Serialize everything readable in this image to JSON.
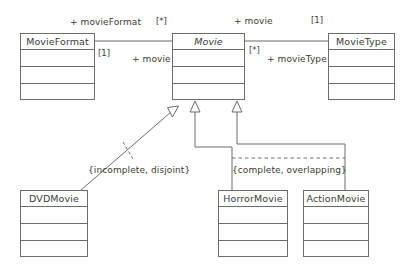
{
  "diagram": {
    "type": "uml-class-diagram",
    "classes": [
      {
        "id": "movieformat",
        "name": "MovieFormat",
        "abstract": false,
        "compartments": 3
      },
      {
        "id": "movie",
        "name": "Movie",
        "abstract": true,
        "compartments": 3
      },
      {
        "id": "movietype",
        "name": "MovieType",
        "abstract": false,
        "compartments": 3
      },
      {
        "id": "dvdmovie",
        "name": "DVDMovie",
        "abstract": false,
        "compartments": 3
      },
      {
        "id": "horrormovie",
        "name": "HorrorMovie",
        "abstract": false,
        "compartments": 3
      },
      {
        "id": "actionmovie",
        "name": "ActionMovie",
        "abstract": false,
        "compartments": 3
      }
    ],
    "association_labels": {
      "movieformat_role": "+ movieFormat",
      "movieformat_multiplicity": "[*]",
      "movie_role_left": "+ movie",
      "movie_multiplicity_left": "[1]",
      "movie_role_right": "+ movie",
      "movie_multiplicity_right": "[1]",
      "movie_multiplicity_center": "[*]",
      "movietype_role": "+ movieType"
    },
    "constraints": {
      "dvd_generalization": "{incomplete, disjoint}",
      "genre_generalization": "{complete, overlapping}"
    },
    "colors": {
      "line": "#6d6d6d",
      "text": "#3a3a3a",
      "background": "#ffffff"
    }
  }
}
